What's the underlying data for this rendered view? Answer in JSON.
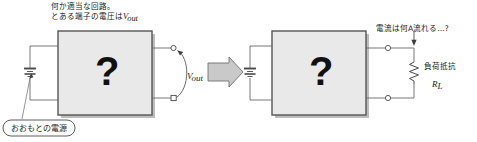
{
  "diagram": {
    "title_hidden": "",
    "left": {
      "caption_line1": "何か適当な回路。",
      "caption_line2_pre": "とある端子の電圧は",
      "caption_line2_sym": "V",
      "caption_line2_sub": "out",
      "box_symbol": "?",
      "source_label": "おおもとの電源",
      "voltage_label_sym": "V",
      "voltage_label_sub": "out"
    },
    "right": {
      "current_question": "電流は何A流れる…?",
      "box_symbol": "?",
      "load_label_line1": "負荷抵抗",
      "load_label_sym": "R",
      "load_label_sub": "L"
    },
    "arrow": "transition-arrow"
  },
  "colors": {
    "box_fill": "#e9e9e9",
    "box_border": "#555555",
    "shadow": "#b9b9b9",
    "wire": "#5a5a5a",
    "text": "#1a1a1a",
    "arrow_fill": "#c9c9c9",
    "arrow_border": "#666666",
    "background": "#ffffff"
  }
}
